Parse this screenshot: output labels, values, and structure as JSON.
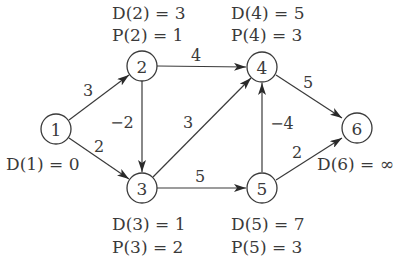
{
  "diagram": {
    "type": "directed-weighted-graph",
    "nodes": [
      {
        "id": "1",
        "label": "1",
        "cx": 56,
        "cy": 129
      },
      {
        "id": "2",
        "label": "2",
        "cx": 142,
        "cy": 66
      },
      {
        "id": "3",
        "label": "3",
        "cx": 142,
        "cy": 188
      },
      {
        "id": "4",
        "label": "4",
        "cx": 262,
        "cy": 67
      },
      {
        "id": "5",
        "label": "5",
        "cx": 262,
        "cy": 188
      },
      {
        "id": "6",
        "label": "6",
        "cx": 357,
        "cy": 128
      }
    ],
    "edges": [
      {
        "from": "1",
        "to": "2",
        "weight": "3"
      },
      {
        "from": "1",
        "to": "3",
        "weight": "2"
      },
      {
        "from": "2",
        "to": "4",
        "weight": "4"
      },
      {
        "from": "2",
        "to": "3",
        "weight": "−2"
      },
      {
        "from": "3",
        "to": "4",
        "weight": "3"
      },
      {
        "from": "3",
        "to": "5",
        "weight": "5"
      },
      {
        "from": "5",
        "to": "4",
        "weight": "−4"
      },
      {
        "from": "4",
        "to": "6",
        "weight": "5"
      },
      {
        "from": "5",
        "to": "6",
        "weight": "2"
      }
    ],
    "annotations": {
      "n1": {
        "d": "D(1) = 0"
      },
      "n2": {
        "d": "D(2) = 3",
        "p": "P(2) = 1"
      },
      "n3": {
        "d": "D(3) = 1",
        "p": "P(3) = 2"
      },
      "n4": {
        "d": "D(4) = 5",
        "p": "P(4) = 3"
      },
      "n5": {
        "d": "D(5) = 7",
        "p": "P(5) = 3"
      },
      "n6": {
        "d": "D(6) = ∞"
      }
    }
  }
}
